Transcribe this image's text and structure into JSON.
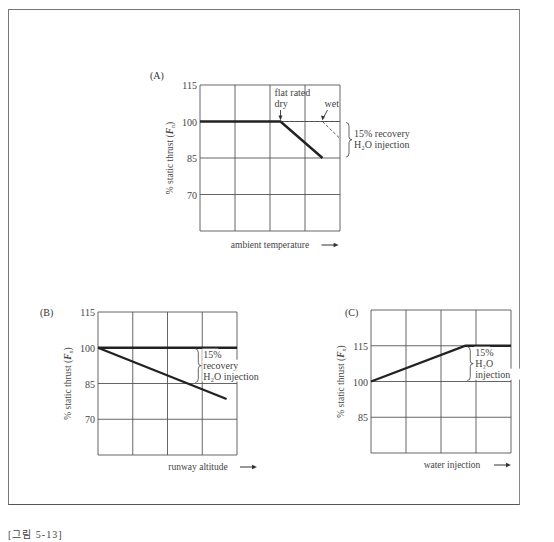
{
  "figure": {
    "caption": "[그림 5-13]"
  },
  "chart_data": [
    {
      "id": "A",
      "panel_label": "(A)",
      "type": "line",
      "xlabel": "ambient temperature",
      "ylabel": "% static thrust (Fn)",
      "yticks": [
        115,
        100,
        85,
        70
      ],
      "ylim": [
        55,
        115
      ],
      "xlim": [
        0,
        4
      ],
      "grid": true,
      "series": [
        {
          "name": "dry",
          "style": "solid-bold",
          "points": [
            [
              0,
              100
            ],
            [
              2.3,
              100
            ],
            [
              3.5,
              85
            ]
          ]
        },
        {
          "name": "wet",
          "style": "dashed",
          "points": [
            [
              2.3,
              100
            ],
            [
              4,
              100
            ]
          ]
        },
        {
          "name": "wet-drop",
          "style": "dashed",
          "points": [
            [
              3.5,
              100
            ],
            [
              4,
              93
            ]
          ]
        }
      ],
      "annotations": [
        {
          "text_line1": "flat rated",
          "text_line2": "dry",
          "arrow_to": [
            2.3,
            100
          ]
        },
        {
          "text": "wet",
          "arrow_to": [
            3.5,
            100
          ]
        },
        {
          "text_line1": "15% recovery",
          "text_line2": "H₂O injection",
          "brace_range": [
            85,
            100
          ]
        }
      ]
    },
    {
      "id": "B",
      "panel_label": "(B)",
      "type": "line",
      "xlabel": "runway altitude",
      "ylabel": "% static thrust (Fn)",
      "yticks": [
        115,
        100,
        85,
        70
      ],
      "ylim": [
        55,
        115
      ],
      "xlim": [
        0,
        4
      ],
      "grid": true,
      "series": [
        {
          "name": "wet",
          "style": "solid-bold",
          "points": [
            [
              0,
              100
            ],
            [
              4,
              100
            ]
          ]
        },
        {
          "name": "dry",
          "style": "solid-bold",
          "points": [
            [
              0,
              100
            ],
            [
              3.7,
              78.5
            ]
          ]
        }
      ],
      "annotations": [
        {
          "text_line1": "15%",
          "text_line2": "recovery",
          "text_line3": "H₂O injection",
          "brace_range": [
            85,
            100
          ]
        }
      ]
    },
    {
      "id": "C",
      "panel_label": "(C)",
      "type": "line",
      "xlabel": "water injection",
      "ylabel": "% static thrust (Fn)",
      "yticks": [
        115,
        100,
        85
      ],
      "ylim": [
        70,
        130
      ],
      "xlim": [
        0,
        4
      ],
      "grid": true,
      "series": [
        {
          "name": "thrust",
          "style": "solid-bold",
          "points": [
            [
              0,
              100
            ],
            [
              2.7,
              115
            ],
            [
              4,
              115
            ]
          ]
        }
      ],
      "annotations": [
        {
          "text_line1": "15%",
          "text_line2": "H₂O",
          "text_line3": "injection",
          "brace_range": [
            100,
            115
          ]
        }
      ]
    }
  ]
}
